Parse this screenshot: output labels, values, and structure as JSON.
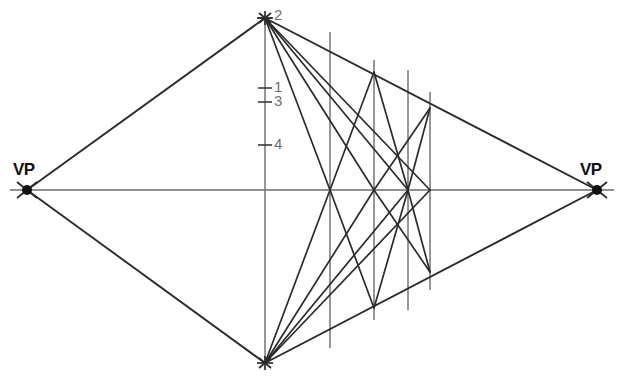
{
  "diagram": {
    "background_color": "#ffffff",
    "line_color": "#2b2b2b",
    "thin_line_color": "#6b6b6b",
    "label_color": "#111111",
    "tick_label_color": "#6e6e6e",
    "vanishing_points": [
      {
        "id": "vp-left",
        "label": "VP",
        "x": 27,
        "y": 190
      },
      {
        "id": "vp-right",
        "label": "VP",
        "x": 597,
        "y": 190
      }
    ],
    "horizon": {
      "label": "horizon-line",
      "x1": 10,
      "y1": 190,
      "x2": 614,
      "y2": 190
    },
    "apex_top": {
      "x": 265,
      "y": 18
    },
    "apex_bottom": {
      "x": 265,
      "y": 363
    },
    "measuring_line": {
      "x": 265,
      "y_top": 18,
      "y_bottom": 363
    },
    "ticks": [
      {
        "label": "2",
        "x": 265,
        "y": 18,
        "label_x": 274,
        "label_y": 6
      },
      {
        "label": "1",
        "x": 265,
        "y": 88,
        "label_x": 274,
        "label_y": 78
      },
      {
        "label": "3",
        "x": 265,
        "y": 102,
        "label_x": 274,
        "label_y": 92
      },
      {
        "label": "4",
        "x": 265,
        "y": 145,
        "label_x": 274,
        "label_y": 135
      }
    ],
    "verticals": [
      {
        "id": "vertical-1",
        "x": 330,
        "y_top": 32,
        "y_bottom": 348
      },
      {
        "id": "vertical-2",
        "x": 374,
        "y_top": 60,
        "y_bottom": 320
      },
      {
        "id": "vertical-3",
        "x": 408,
        "y_top": 70,
        "y_bottom": 310
      },
      {
        "id": "vertical-4",
        "x": 430,
        "y_top": 92,
        "y_bottom": 290
      }
    ],
    "upper_edge": {
      "from_x": 27,
      "from_y": 190,
      "to_x": 265,
      "to_y": 18
    },
    "lower_edge": {
      "from_x": 27,
      "from_y": 190,
      "to_x": 265,
      "to_y": 363
    },
    "upper_right_edge": {
      "from_x": 265,
      "from_y": 18,
      "to_x": 597,
      "to_y": 190
    },
    "lower_right_edge": {
      "from_x": 265,
      "from_y": 363,
      "to_x": 597,
      "to_y": 190
    },
    "diagonals_from_top_apex": [
      {
        "to_x": 330,
        "to_y": 190
      },
      {
        "to_x": 374,
        "to_y": 190
      },
      {
        "to_x": 408,
        "to_y": 190
      },
      {
        "to_x": 430,
        "to_y": 190
      }
    ],
    "diagonals_from_bottom_apex": [
      {
        "to_x": 330,
        "to_y": 190
      },
      {
        "to_x": 374,
        "to_y": 190
      },
      {
        "to_x": 408,
        "to_y": 190
      },
      {
        "to_x": 430,
        "to_y": 190
      }
    ],
    "zigzag_upper": [
      {
        "x1": 330,
        "y1": 190,
        "x2": 374,
        "y2": 72
      },
      {
        "x1": 374,
        "y1": 72,
        "x2": 408,
        "y2": 190
      },
      {
        "x1": 408,
        "y1": 190,
        "x2": 430,
        "y2": 108
      },
      {
        "x1": 374,
        "y1": 190,
        "x2": 430,
        "y2": 108
      }
    ],
    "zigzag_lower": [
      {
        "x1": 330,
        "y1": 190,
        "x2": 374,
        "y2": 308
      },
      {
        "x1": 374,
        "y1": 308,
        "x2": 408,
        "y2": 190
      },
      {
        "x1": 408,
        "y1": 190,
        "x2": 430,
        "y2": 272
      },
      {
        "x1": 374,
        "y1": 190,
        "x2": 430,
        "y2": 272
      }
    ]
  }
}
